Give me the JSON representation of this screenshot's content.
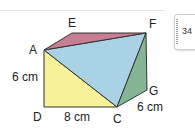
{
  "diagram": {
    "type": "3d-prism-geometry",
    "points": {
      "A": {
        "label": "A"
      },
      "E": {
        "label": "E"
      },
      "F": {
        "label": "F"
      },
      "D": {
        "label": "D"
      },
      "C": {
        "label": "C"
      },
      "G": {
        "label": "G"
      }
    },
    "measurements": {
      "AD": "6 cm",
      "DC": "8 cm",
      "CG": "6 cm"
    },
    "faces": [
      {
        "name": "triangle-ADC",
        "color": "#f7f29a"
      },
      {
        "name": "triangle-ACF",
        "color": "#a9d3e4"
      },
      {
        "name": "triangle-AEF",
        "color": "#c77d92"
      },
      {
        "name": "triangle-CGF",
        "color": "#86b596"
      }
    ]
  },
  "page_tab": {
    "number": "34"
  }
}
